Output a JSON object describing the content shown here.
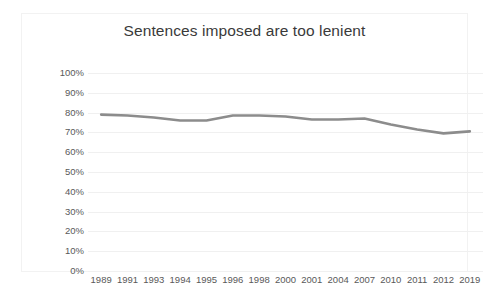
{
  "chart_data": {
    "type": "line",
    "title": "Sentences imposed are too lenient",
    "xlabel": "",
    "ylabel": "",
    "ylim": [
      0,
      100
    ],
    "y_ticks": [
      100,
      90,
      80,
      70,
      60,
      50,
      40,
      30,
      20,
      10,
      0
    ],
    "y_tick_labels": [
      "100%",
      "90%",
      "80%",
      "70%",
      "60%",
      "50%",
      "40%",
      "30%",
      "20%",
      "10%",
      "0%"
    ],
    "grid": true,
    "legend": "none",
    "categories": [
      "1989",
      "1991",
      "1993",
      "1994",
      "1995",
      "1996",
      "1998",
      "2000",
      "2001",
      "2004",
      "2007",
      "2010",
      "2011",
      "2012",
      "2019"
    ],
    "series": [
      {
        "name": "Sentences imposed are too lenient",
        "color": "#8c8c8c",
        "values": [
          79,
          78.5,
          77.5,
          76,
          76,
          78.5,
          78.5,
          78,
          76.5,
          76.5,
          77,
          74,
          71.5,
          69.5,
          70.5
        ]
      }
    ]
  },
  "figure": {
    "title": "Sentences imposed are too lenient",
    "background_color": "#ffffff",
    "border_color": "#f2f2f2",
    "gridline_color": "#f0f0f0",
    "tick_label_color": "#595959",
    "title_color": "#3a3a3a"
  }
}
